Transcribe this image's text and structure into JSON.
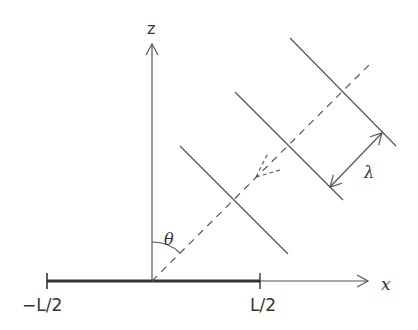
{
  "figure": {
    "axes": {
      "x_label": "x",
      "z_label": "z"
    },
    "aperture": {
      "left_label": "−L/2",
      "right_label": "L/2"
    },
    "angle_label": "θ",
    "wavelength_label": "λ",
    "wavefront_count": 3,
    "colors": {
      "stroke": "#555555",
      "aperture": "#333333",
      "text": "#333333"
    }
  }
}
